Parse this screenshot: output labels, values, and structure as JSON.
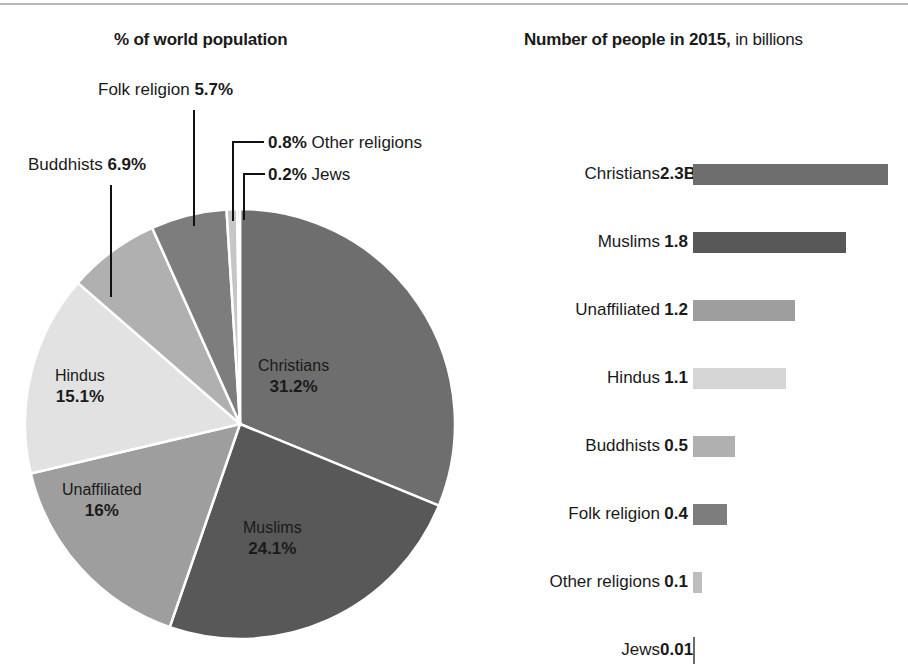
{
  "top_rule_color": "#b9b9b9",
  "pie_panel": {
    "title": "% of world population"
  },
  "bar_panel": {
    "title_bold": "Number of people in 2015,",
    "title_light": " in billions"
  },
  "callouts": {
    "folk": "Folk religion 5.7%",
    "folk_name": "Folk religion ",
    "folk_value": "5.7%",
    "buddhists_name": "Buddhists ",
    "buddhists_value": "6.9%",
    "other_value": "0.8%",
    "other_name": " Other religions",
    "jews_value": "0.2%",
    "jews_name": " Jews"
  },
  "pie_labels": {
    "christians_name": "Christians",
    "christians_value": "31.2%",
    "muslims_name": "Muslims",
    "muslims_value": "24.1%",
    "unaffiliated_name": "Unaffiliated",
    "unaffiliated_value": "16%",
    "hindus_name": "Hindus",
    "hindus_value": "15.1%"
  },
  "bars": [
    {
      "category": "Christians",
      "value_label": "2.3B",
      "value": 2.3,
      "color": "#6e6e6e"
    },
    {
      "category": "Muslims",
      "value_label": "1.8",
      "value": 1.8,
      "color": "#585858"
    },
    {
      "category": "Unaffiliated",
      "value_label": "1.2",
      "value": 1.2,
      "color": "#9e9e9e"
    },
    {
      "category": "Hindus",
      "value_label": "1.1",
      "value": 1.1,
      "color": "#d5d5d5"
    },
    {
      "category": "Buddhists",
      "value_label": "0.5",
      "value": 0.5,
      "color": "#b0b0b0"
    },
    {
      "category": "Folk religion",
      "value_label": "0.4",
      "value": 0.4,
      "color": "#7d7d7d"
    },
    {
      "category": "Other religions",
      "value_label": "0.1",
      "value": 0.1,
      "color": "#bdbdbd"
    },
    {
      "category": "Jews",
      "value_label": "0.01",
      "value": 0.01,
      "color": "#6a6a6a"
    }
  ],
  "chart_data": [
    {
      "type": "pie",
      "title": "% of world population",
      "categories": [
        "Christians",
        "Muslims",
        "Unaffiliated",
        "Hindus",
        "Buddhists",
        "Folk religion",
        "Other religions",
        "Jews"
      ],
      "values": [
        31.2,
        24.1,
        16,
        15.1,
        6.9,
        5.7,
        0.8,
        0.2
      ],
      "value_labels": [
        "31.2%",
        "24.1%",
        "16%",
        "15.1%",
        "6.9%",
        "5.7%",
        "0.8%",
        "0.2%"
      ],
      "unit": "percent of world population",
      "colors": [
        "#6e6e6e",
        "#585858",
        "#9e9e9e",
        "#e2e2e2",
        "#b0b0b0",
        "#7d7d7d",
        "#c6c6c6",
        "#adadad"
      ],
      "start_angle_deg": 0,
      "direction": "clockwise",
      "inside_labels": [
        "Christians",
        "Muslims",
        "Unaffiliated",
        "Hindus"
      ],
      "callout_labels": [
        "Folk religion",
        "Buddhists",
        "Other religions",
        "Jews"
      ],
      "legend": "none",
      "grid": false
    },
    {
      "type": "bar",
      "orientation": "horizontal",
      "title": "Number of people in 2015, in billions",
      "categories": [
        "Christians",
        "Muslims",
        "Unaffiliated",
        "Hindus",
        "Buddhists",
        "Folk religion",
        "Other religions",
        "Jews"
      ],
      "values": [
        2.3,
        1.8,
        1.2,
        1.1,
        0.5,
        0.4,
        0.1,
        0.01
      ],
      "data_labels": [
        "2.3B",
        "1.8",
        "1.2",
        "1.1",
        "0.5",
        "0.4",
        "0.1",
        "0.01"
      ],
      "xlabel": "billions of people",
      "ylabel": "",
      "xlim": [
        0,
        2.3
      ],
      "grid": false,
      "legend": "none"
    }
  ]
}
